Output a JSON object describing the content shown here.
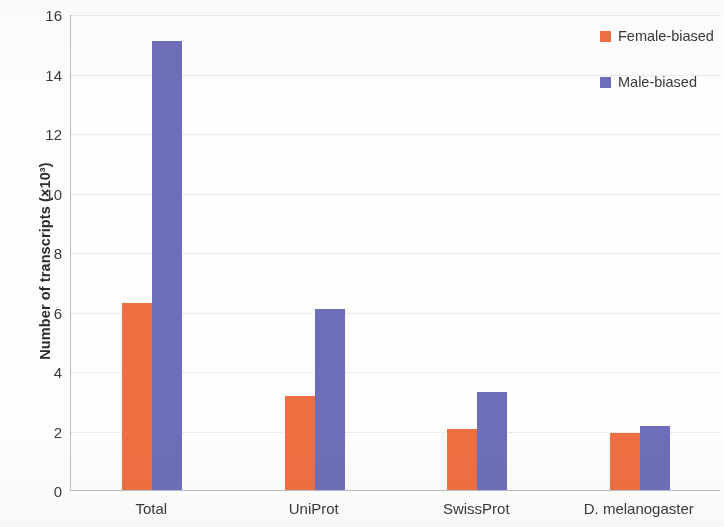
{
  "chart_data": {
    "type": "bar",
    "title": "",
    "xlabel": "",
    "ylabel": "Number of transcripts (×10³)",
    "categories": [
      "Total",
      "UniProt",
      "SwissProt",
      "D. melanogaster"
    ],
    "series": [
      {
        "name": "Female-biased",
        "color": "#ee6f42",
        "values": [
          6.3,
          3.15,
          2.05,
          1.9
        ]
      },
      {
        "name": "Male-biased",
        "color": "#6e6eb8",
        "values": [
          15.1,
          6.1,
          3.3,
          2.15
        ]
      }
    ],
    "ylim": [
      0,
      16
    ],
    "ytick_labels": [
      "0",
      "2",
      "4",
      "6",
      "8",
      "10",
      "12",
      "14",
      "16"
    ],
    "ytick_values": [
      0,
      2,
      4,
      6,
      8,
      10,
      12,
      14,
      16
    ],
    "grid": true,
    "grid_axis": "y",
    "legend_position": "right-top"
  },
  "legend": {
    "entries": [
      {
        "label": "Female-biased",
        "color": "#ee6f42"
      },
      {
        "label": "Male-biased",
        "color": "#6e6eb8"
      }
    ]
  }
}
